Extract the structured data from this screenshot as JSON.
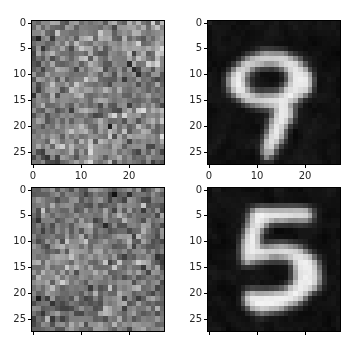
{
  "figure": {
    "width": 359,
    "height": 348,
    "background_color": "#ffffff",
    "layout": "2x2 grid of image subplots",
    "tick_label_color": "#262626",
    "spine_color": "#000000"
  },
  "chart_data": [
    {
      "type": "heatmap",
      "name": "top-left-noise-image",
      "position": "row 1, column 1",
      "title": "",
      "xlabel": "",
      "ylabel": "",
      "colormap": "gray",
      "image_shape": [
        28,
        28
      ],
      "xlim": [
        -0.5,
        27.5
      ],
      "ylim": [
        27.5,
        -0.5
      ],
      "y_inverted": true,
      "grid": false,
      "xticks": [
        0,
        10,
        20
      ],
      "xticklabels": [
        "0",
        "10",
        "20"
      ],
      "yticks": [
        0,
        5,
        10,
        15,
        20,
        25
      ],
      "yticklabels": [
        "0",
        "5",
        "10",
        "15",
        "20",
        "25"
      ],
      "content_description": "random gray noise, mid-gray mean with faint brighter diagonal structure",
      "pixel_value_range": [
        0,
        255
      ],
      "seed": 11,
      "noise_mean": 128,
      "noise_spread": 58,
      "signal_strength": 26
    },
    {
      "type": "heatmap",
      "name": "top-right-digit-image",
      "position": "row 1, column 2",
      "title": "",
      "xlabel": "",
      "ylabel": "",
      "colormap": "gray",
      "image_shape": [
        28,
        28
      ],
      "xlim": [
        -0.5,
        27.5
      ],
      "ylim": [
        27.5,
        -0.5
      ],
      "y_inverted": true,
      "grid": false,
      "xticks": [
        0,
        10,
        20
      ],
      "xticklabels": [
        "0",
        "10",
        "20"
      ],
      "yticks": [
        0,
        5,
        10,
        15,
        20,
        25
      ],
      "yticklabels": [
        "0",
        "5",
        "10",
        "15",
        "20",
        "25"
      ],
      "content_description": "handwritten MNIST digit nine on near-black background",
      "digit": "9",
      "pixel_value_range": [
        0,
        255
      ],
      "background_level": 18,
      "stroke_level": 235
    },
    {
      "type": "heatmap",
      "name": "bottom-left-noise-image",
      "position": "row 2, column 1",
      "title": "",
      "xlabel": "",
      "ylabel": "",
      "colormap": "gray",
      "image_shape": [
        28,
        28
      ],
      "xlim": [
        -0.5,
        27.5
      ],
      "ylim": [
        27.5,
        -0.5
      ],
      "y_inverted": true,
      "grid": false,
      "xticks": [
        0,
        10,
        20
      ],
      "xticklabels": [
        "",
        "",
        ""
      ],
      "xticklabels_visible": false,
      "yticks": [
        0,
        5,
        10,
        15,
        20,
        25
      ],
      "yticklabels": [
        "0",
        "5",
        "10",
        "15",
        "20",
        "25"
      ],
      "content_description": "random gray noise, mid-gray mean with faint brighter blob structure",
      "pixel_value_range": [
        0,
        255
      ],
      "seed": 29,
      "noise_mean": 124,
      "noise_spread": 56,
      "signal_strength": 24
    },
    {
      "type": "heatmap",
      "name": "bottom-right-digit-image",
      "position": "row 2, column 2",
      "title": "",
      "xlabel": "",
      "ylabel": "",
      "colormap": "gray",
      "image_shape": [
        28,
        28
      ],
      "xlim": [
        -0.5,
        27.5
      ],
      "ylim": [
        27.5,
        -0.5
      ],
      "y_inverted": true,
      "grid": false,
      "xticks": [
        0,
        10,
        20
      ],
      "xticklabels": [
        "",
        "",
        ""
      ],
      "xticklabels_visible": false,
      "yticks": [
        0,
        5,
        10,
        15,
        20,
        25
      ],
      "yticklabels": [
        "0",
        "5",
        "10",
        "15",
        "20",
        "25"
      ],
      "content_description": "handwritten MNIST digit five on near-black background",
      "digit": "5",
      "pixel_value_range": [
        0,
        255
      ],
      "background_level": 16,
      "stroke_level": 238
    }
  ]
}
